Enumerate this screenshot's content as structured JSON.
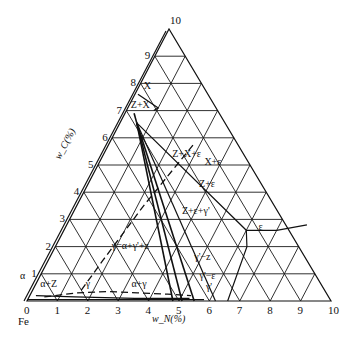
{
  "diagram": {
    "corner_bottom_left": "Fe",
    "axis_n_label": "w_N(%)",
    "axis_c_label": "w_C(%)",
    "n_ticks": [
      "0",
      "1",
      "2",
      "3",
      "4",
      "5",
      "6",
      "7",
      "8",
      "9",
      "10"
    ],
    "c_ticks": [
      "1",
      "2",
      "3",
      "4",
      "5",
      "6",
      "7",
      "8",
      "9",
      "10"
    ],
    "regions": [
      {
        "label": "α",
        "wN": -0.6,
        "wC": 0.8
      },
      {
        "label": "α+Z",
        "wN": 0.2,
        "wC": 0.5
      },
      {
        "label": "γ",
        "wN": 1.7,
        "wC": 0.5
      },
      {
        "label": "α+γ",
        "wN": 3.2,
        "wC": 0.5
      },
      {
        "label": "γ=α+γ'+z",
        "wN": 1.9,
        "wC": 1.9
      },
      {
        "label": "γ'−z",
        "wN": 4.8,
        "wC": 1.5
      },
      {
        "label": "γ'−ε",
        "wN": 5.3,
        "wC": 0.8
      },
      {
        "label": "γ'",
        "wN": 5.7,
        "wC": 0.4
      },
      {
        "label": "Z+ε+γ'",
        "wN": 3.6,
        "wC": 3.2
      },
      {
        "label": "Z+ε",
        "wN": 3.7,
        "wC": 4.2
      },
      {
        "label": "Z+X+ε",
        "wN": 2.3,
        "wC": 5.3
      },
      {
        "label": "X+ε",
        "wN": 3.5,
        "wC": 5.0
      },
      {
        "label": "ε",
        "wN": 6.4,
        "wC": 2.6
      },
      {
        "label": "X",
        "wN": 0.2,
        "wC": 7.8
      },
      {
        "label": "Z+X",
        "wN": 0.1,
        "wC": 7.1
      }
    ]
  }
}
